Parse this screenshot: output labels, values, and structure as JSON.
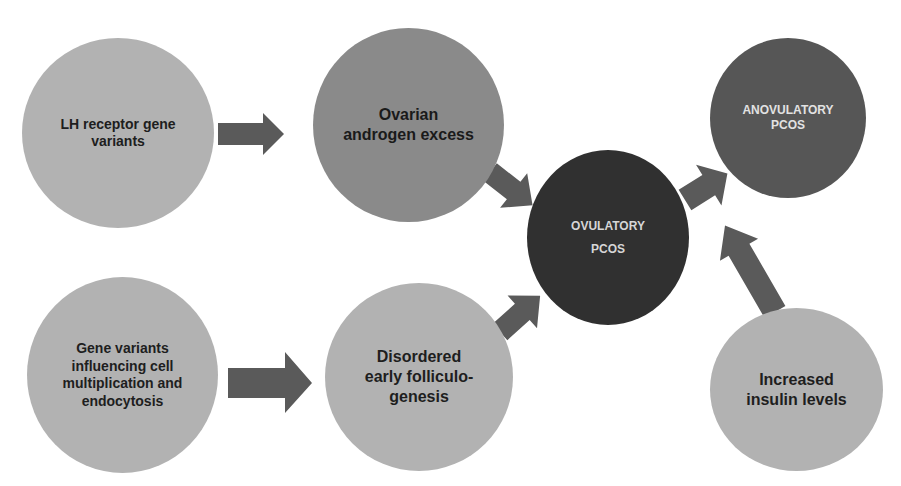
{
  "diagram": {
    "colors": {
      "light_node": "#b2b2b2",
      "mid_node": "#8a8a8a",
      "dark_node": "#303030",
      "darkmid_node": "#565656",
      "arrow": "#5a5a5a"
    },
    "nodes": [
      {
        "id": "lh-receptor",
        "label": "LH receptor gene variants"
      },
      {
        "id": "ovarian-androgen",
        "label": "Ovarian androgen excess"
      },
      {
        "id": "ovulatory-pcos",
        "label": "OVULATORY PCOS"
      },
      {
        "id": "anovulatory-pcos",
        "label": "ANOVULATORY PCOS"
      },
      {
        "id": "gene-variants-cell",
        "label": "Gene variants influencing cell multiplication and endocytosis"
      },
      {
        "id": "disordered-folliculogenesis",
        "label": "Disordered early folliculo-genesis"
      },
      {
        "id": "increased-insulin",
        "label": "Increased insulin levels"
      }
    ],
    "edges": [
      {
        "from": "lh-receptor",
        "to": "ovarian-androgen"
      },
      {
        "from": "ovarian-androgen",
        "to": "ovulatory-pcos"
      },
      {
        "from": "gene-variants-cell",
        "to": "disordered-folliculogenesis"
      },
      {
        "from": "disordered-folliculogenesis",
        "to": "ovulatory-pcos"
      },
      {
        "from": "ovulatory-pcos",
        "to": "anovulatory-pcos"
      },
      {
        "from": "increased-insulin",
        "to": "anovulatory-pcos"
      }
    ]
  }
}
